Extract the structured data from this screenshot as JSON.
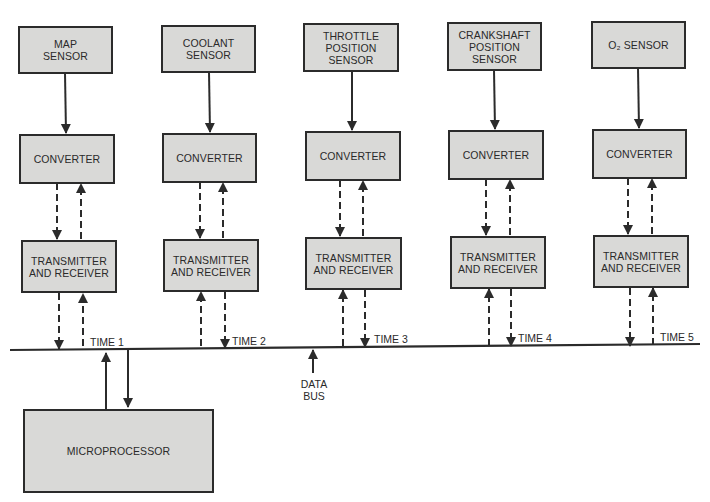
{
  "diagram": {
    "columns": [
      {
        "sensor": "MAP\nSENSOR",
        "converter": "CONVERTER",
        "transceiver": "TRANSMITTER\nAND RECEIVER",
        "time_label": "TIME 1"
      },
      {
        "sensor": "COOLANT\nSENSOR",
        "converter": "CONVERTER",
        "transceiver": "TRANSMITTER\nAND RECEIVER",
        "time_label": "TIME 2"
      },
      {
        "sensor": "THROTTLE\nPOSITION\nSENSOR",
        "converter": "CONVERTER",
        "transceiver": "TRANSMITTER\nAND RECEIVER",
        "time_label": "TIME 3"
      },
      {
        "sensor": "CRANKSHAFT\nPOSITION\nSENSOR",
        "converter": "CONVERTER",
        "transceiver": "TRANSMITTER\nAND RECEIVER",
        "time_label": "TIME 4"
      },
      {
        "sensor": "O₂ SENSOR",
        "converter": "CONVERTER",
        "transceiver": "TRANSMITTER\nAND RECEIVER",
        "time_label": "TIME 5"
      }
    ],
    "bus_label": "DATA\nBUS",
    "microprocessor": "MICROPROCESSOR",
    "colors": {
      "box_fill": "#d9d9d7",
      "line": "#2b2b2b",
      "background": "#ffffff"
    }
  }
}
